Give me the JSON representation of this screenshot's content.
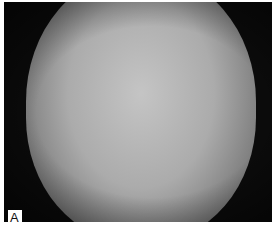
{
  "figure": {
    "panel_label": "A",
    "image_description": "Grayscale clinical photograph (placeholder rendering)",
    "colors": {
      "background": "#0b0b0b",
      "frame": "#ffffff",
      "label_text": "#111111"
    }
  }
}
